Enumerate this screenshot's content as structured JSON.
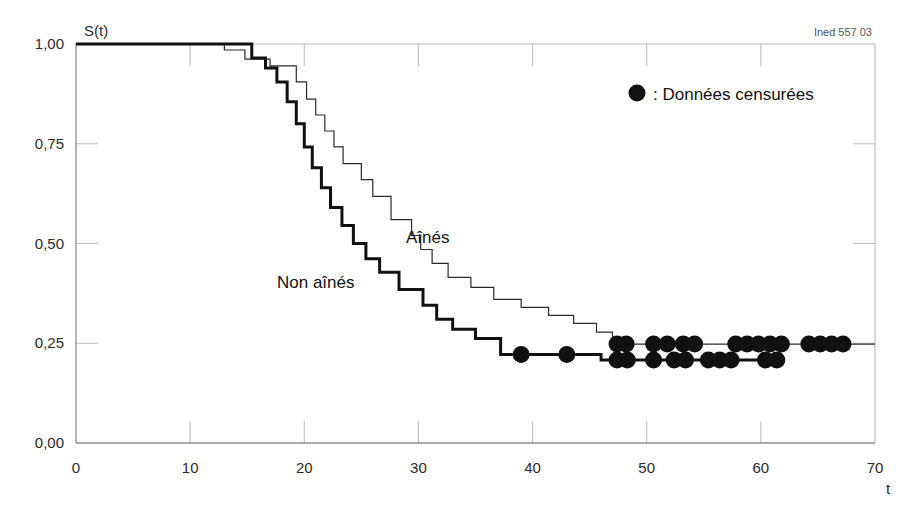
{
  "figure": {
    "source_note": "Ined 557 03",
    "background_color": "#ffffff"
  },
  "legend": {
    "marker_symbol": "●",
    "separator": ":",
    "label": "Données censurées",
    "full_text": "● : Données censurées"
  },
  "series_labels": {
    "aines": "Aînés",
    "non_aines": "Non aînés"
  },
  "axes": {
    "y_title": "S(t)",
    "x_title": "t",
    "y_ticks": [
      "0,00",
      "0,25",
      "0,50",
      "0,75",
      "1,00"
    ],
    "x_ticks": [
      "0",
      "10",
      "20",
      "30",
      "40",
      "50",
      "60",
      "70"
    ]
  },
  "chart_data": {
    "type": "line",
    "title": "",
    "subtitle": "",
    "xlabel": "t",
    "ylabel": "S(t)",
    "xlim": [
      0,
      70
    ],
    "ylim": [
      0.0,
      1.0
    ],
    "grid": false,
    "legend_position": "top-right",
    "x_tick_values": [
      0,
      10,
      20,
      30,
      40,
      50,
      60,
      70
    ],
    "y_tick_values": [
      0.0,
      0.25,
      0.5,
      0.75,
      1.0
    ],
    "y_tick_labels": [
      "0,00",
      "0,25",
      "0,50",
      "0,75",
      "1,00"
    ],
    "annotations": [
      {
        "text": "Aînés",
        "x": 31.5,
        "y": 0.55
      },
      {
        "text": "Non aînés",
        "x": 22.5,
        "y": 0.45
      },
      {
        "text": "Ined 557 03",
        "x": 66,
        "y": 1.04
      }
    ],
    "series": [
      {
        "name": "Aînés",
        "style": "step",
        "line_width": 1.2,
        "color": "#2b2b2b",
        "steps": [
          [
            0,
            1.0
          ],
          [
            13.0,
            1.0
          ],
          [
            13.0,
            0.985
          ],
          [
            14.8,
            0.985
          ],
          [
            14.8,
            0.962
          ],
          [
            17.0,
            0.962
          ],
          [
            17.0,
            0.945
          ],
          [
            19.3,
            0.945
          ],
          [
            19.3,
            0.905
          ],
          [
            20.2,
            0.905
          ],
          [
            20.2,
            0.862
          ],
          [
            21.0,
            0.862
          ],
          [
            21.0,
            0.822
          ],
          [
            21.8,
            0.822
          ],
          [
            21.8,
            0.782
          ],
          [
            22.6,
            0.782
          ],
          [
            22.6,
            0.742
          ],
          [
            23.4,
            0.742
          ],
          [
            23.4,
            0.7
          ],
          [
            25.0,
            0.7
          ],
          [
            25.0,
            0.66
          ],
          [
            26.0,
            0.66
          ],
          [
            26.0,
            0.618
          ],
          [
            27.6,
            0.618
          ],
          [
            27.6,
            0.56
          ],
          [
            29.4,
            0.56
          ],
          [
            29.4,
            0.52
          ],
          [
            30.2,
            0.52
          ],
          [
            30.2,
            0.485
          ],
          [
            31.2,
            0.485
          ],
          [
            31.2,
            0.45
          ],
          [
            32.6,
            0.45
          ],
          [
            32.6,
            0.415
          ],
          [
            34.6,
            0.415
          ],
          [
            34.6,
            0.39
          ],
          [
            36.6,
            0.39
          ],
          [
            36.6,
            0.36
          ],
          [
            39.0,
            0.36
          ],
          [
            39.0,
            0.34
          ],
          [
            41.4,
            0.34
          ],
          [
            41.4,
            0.32
          ],
          [
            43.6,
            0.32
          ],
          [
            43.6,
            0.3
          ],
          [
            45.6,
            0.3
          ],
          [
            45.6,
            0.278
          ],
          [
            47.0,
            0.278
          ],
          [
            47.0,
            0.248
          ],
          [
            70.0,
            0.248
          ]
        ],
        "censored_points": [
          [
            47.4,
            0.248
          ],
          [
            48.2,
            0.248
          ],
          [
            50.6,
            0.248
          ],
          [
            51.8,
            0.248
          ],
          [
            53.2,
            0.248
          ],
          [
            54.2,
            0.248
          ],
          [
            57.8,
            0.248
          ],
          [
            58.8,
            0.248
          ],
          [
            59.8,
            0.248
          ],
          [
            60.8,
            0.248
          ],
          [
            61.8,
            0.248
          ],
          [
            64.2,
            0.248
          ],
          [
            65.2,
            0.248
          ],
          [
            66.2,
            0.248
          ],
          [
            67.2,
            0.248
          ]
        ]
      },
      {
        "name": "Non aînés",
        "style": "step",
        "line_width": 3.0,
        "color": "#111111",
        "steps": [
          [
            0,
            1.0
          ],
          [
            15.4,
            1.0
          ],
          [
            15.4,
            0.965
          ],
          [
            16.6,
            0.965
          ],
          [
            16.6,
            0.94
          ],
          [
            17.6,
            0.94
          ],
          [
            17.6,
            0.905
          ],
          [
            18.5,
            0.905
          ],
          [
            18.5,
            0.855
          ],
          [
            19.3,
            0.855
          ],
          [
            19.3,
            0.8
          ],
          [
            20.0,
            0.8
          ],
          [
            20.0,
            0.742
          ],
          [
            20.7,
            0.742
          ],
          [
            20.7,
            0.69
          ],
          [
            21.5,
            0.69
          ],
          [
            21.5,
            0.64
          ],
          [
            22.3,
            0.64
          ],
          [
            22.3,
            0.59
          ],
          [
            23.3,
            0.59
          ],
          [
            23.3,
            0.545
          ],
          [
            24.3,
            0.545
          ],
          [
            24.3,
            0.5
          ],
          [
            25.4,
            0.5
          ],
          [
            25.4,
            0.462
          ],
          [
            26.6,
            0.462
          ],
          [
            26.6,
            0.428
          ],
          [
            28.3,
            0.428
          ],
          [
            28.3,
            0.385
          ],
          [
            30.4,
            0.385
          ],
          [
            30.4,
            0.345
          ],
          [
            31.6,
            0.345
          ],
          [
            31.6,
            0.31
          ],
          [
            33.0,
            0.31
          ],
          [
            33.0,
            0.285
          ],
          [
            35.0,
            0.285
          ],
          [
            35.0,
            0.262
          ],
          [
            37.2,
            0.262
          ],
          [
            37.2,
            0.222
          ],
          [
            46.0,
            0.222
          ],
          [
            46.0,
            0.208
          ],
          [
            62.0,
            0.208
          ]
        ],
        "censored_points": [
          [
            39.0,
            0.222
          ],
          [
            43.0,
            0.222
          ],
          [
            47.4,
            0.208
          ],
          [
            48.3,
            0.208
          ],
          [
            50.6,
            0.208
          ],
          [
            52.4,
            0.208
          ],
          [
            53.4,
            0.208
          ],
          [
            55.4,
            0.208
          ],
          [
            56.4,
            0.208
          ],
          [
            57.4,
            0.208
          ],
          [
            60.4,
            0.208
          ],
          [
            61.4,
            0.208
          ]
        ]
      }
    ]
  }
}
